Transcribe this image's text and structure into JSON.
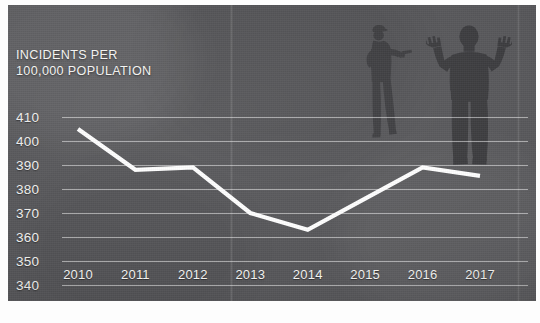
{
  "chart_data": {
    "type": "line",
    "title": "INCIDENTS PER\n100,000 POPULATION",
    "title_line1": "INCIDENTS PER",
    "title_line2": "100,000 POPULATION",
    "xlabel": "",
    "ylabel": "INCIDENTS PER 100,000 POPULATION",
    "categories": [
      "2010",
      "2011",
      "2012",
      "2013",
      "2014",
      "2015",
      "2016",
      "2017"
    ],
    "values": [
      405,
      388,
      389,
      370,
      363,
      376,
      389,
      385.5
    ],
    "series": [
      {
        "name": "Incidents per 100,000 population",
        "values": [
          405,
          388,
          389,
          370,
          363,
          376,
          389,
          385.5
        ],
        "color": "#ffffff"
      }
    ],
    "ylim": [
      340,
      410
    ],
    "yticks": [
      "340",
      "350",
      "360",
      "370",
      "380",
      "390",
      "400",
      "410"
    ],
    "ytick_values": [
      340,
      350,
      360,
      370,
      380,
      390,
      400,
      410
    ],
    "grid": true,
    "legend": "none",
    "line_color": "#ffffff",
    "background_color": "#565659",
    "gridline_color": "#ffffff"
  },
  "overlay": {
    "figures": [
      {
        "name": "gunman-silhouette",
        "description": "person aiming a handgun",
        "color": "#3d3d40"
      },
      {
        "name": "hands-raised-silhouette",
        "description": "person with both hands raised",
        "color": "#3a3a3d"
      }
    ]
  }
}
